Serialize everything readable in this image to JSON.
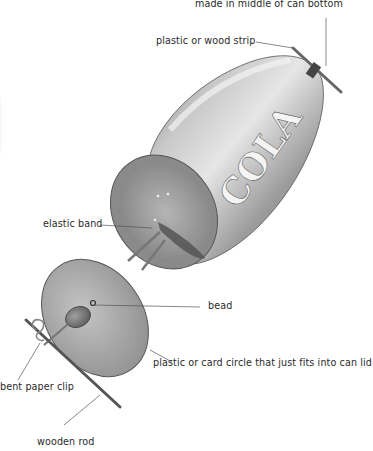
{
  "diagram": {
    "can_text": "COLA",
    "labels": {
      "hole": "made in middle of can bottom",
      "strip": "plastic or wood strip",
      "elastic": "elastic band",
      "bead": "bead",
      "circle": "plastic or card circle that just fits into can lid",
      "clip": "bent paper clip",
      "rod": "wooden rod"
    },
    "colors": {
      "can_body": "#9a9a9a",
      "can_highlight": "#d8d8d8",
      "disc": "#a8a8a8",
      "leader_line": "#555555",
      "text": "#2a2a2a"
    }
  }
}
